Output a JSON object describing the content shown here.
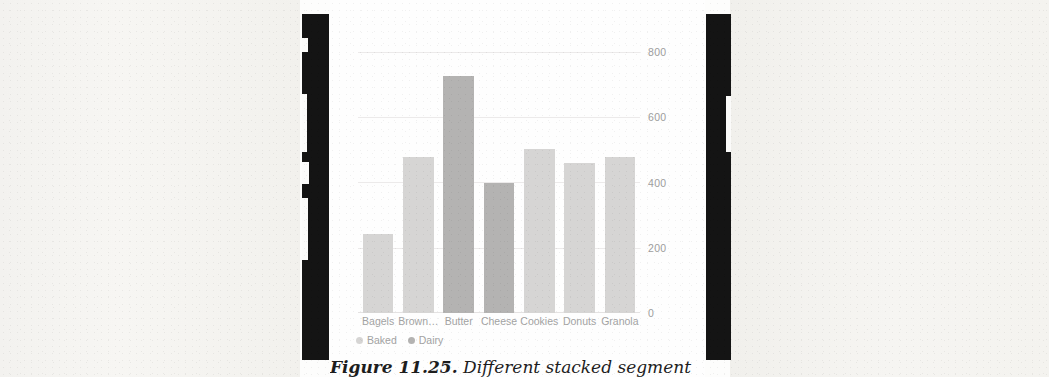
{
  "chart_data": {
    "type": "bar",
    "title": "",
    "subtitle": "",
    "xlabel": "",
    "ylabel": "",
    "ylim": [
      0,
      800
    ],
    "yticks": [
      "0",
      "200",
      "400",
      "600",
      "800"
    ],
    "grid": true,
    "legend_position": "bottom-left",
    "categories": [
      "Bagels",
      "Brown…",
      "Butter",
      "Cheese",
      "Cookies",
      "Donuts",
      "Granola"
    ],
    "values": [
      242,
      477,
      728,
      398,
      502,
      461,
      477
    ],
    "point_series": [
      "Baked",
      "Baked",
      "Dairy",
      "Dairy",
      "Baked",
      "Baked",
      "Baked"
    ],
    "series": [
      {
        "name": "Baked",
        "color": "#d6d5d4"
      },
      {
        "name": "Dairy",
        "color": "#b4b3b2"
      }
    ]
  },
  "axis": {
    "y_ticks": [
      {
        "label": "800",
        "value": 800
      },
      {
        "label": "600",
        "value": 600
      },
      {
        "label": "400",
        "value": 400
      },
      {
        "label": "200",
        "value": 200
      },
      {
        "label": "0",
        "value": 0
      }
    ]
  },
  "legend": {
    "items": [
      {
        "label": "Baked",
        "color": "#d6d5d4"
      },
      {
        "label": "Dairy",
        "color": "#b4b3b2"
      }
    ]
  },
  "caption": {
    "number": "Figure 11.25.",
    "text": "Different stacked segment"
  },
  "colors": {
    "baked": "#d6d5d4",
    "dairy": "#b4b3b2",
    "grid": "#eceaea",
    "tick_text": "#9d9d9d",
    "label_text": "#a2a2a2",
    "gutter": "#141414"
  }
}
